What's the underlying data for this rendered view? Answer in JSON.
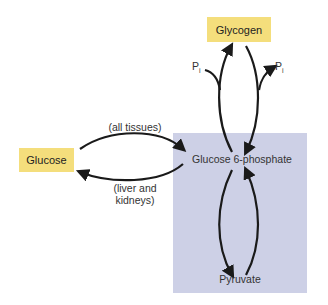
{
  "nodes": {
    "glycogen": "Glycogen",
    "glucose": "Glucose",
    "g6p": "Glucose 6-phosphate",
    "pyruvate": "Pyruvate"
  },
  "labels": {
    "top_path": "(all tissues)",
    "bottom_path_line1": "(liver and",
    "bottom_path_line2": "kidneys)",
    "pi_left": "P",
    "pi_left_sub": "i",
    "pi_right": "P",
    "pi_right_sub": "i"
  },
  "colors": {
    "node_fill": "#f4de7c",
    "region_fill": "#cdd0e6",
    "arrow": "#1a1a1a"
  }
}
